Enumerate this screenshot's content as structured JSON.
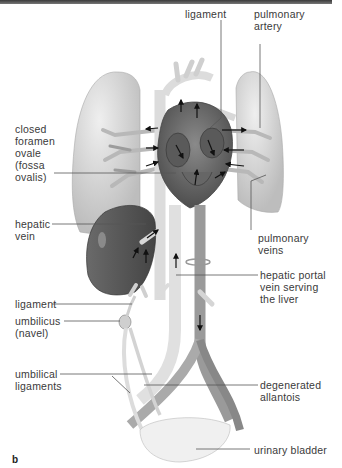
{
  "figure": {
    "panel_label": "b",
    "colors": {
      "lung": "#d9d9d9",
      "lung_shade": "#bdbdbd",
      "heart": "#6f6f6f",
      "heart_dark": "#4e4e4e",
      "vessel": "#e6e6e6",
      "vessel_dark": "#9a9a9a",
      "liver": "#5f5f5f",
      "label_text": "#3a3a3a",
      "leader_line": "#555555",
      "arrow": "#111111"
    },
    "labels": {
      "ligament_top": "ligament",
      "pulmonary_artery": "pulmonary\nartery",
      "closed_foramen_ovale": "closed\nforamen\novale\n(fossa\novalis)",
      "hepatic_vein": "hepatic\nvein",
      "pulmonary_veins": "pulmonary\nveins",
      "hepatic_portal_vein": "hepatic portal\nvein serving\nthe liver",
      "ligament_bottom": "ligament",
      "umbilicus": "umbilicus\n(navel)",
      "umbilical_ligaments": "umbilical\nligaments",
      "degenerated_allantois": "degenerated\nallantois",
      "urinary_bladder": "urinary bladder"
    }
  }
}
